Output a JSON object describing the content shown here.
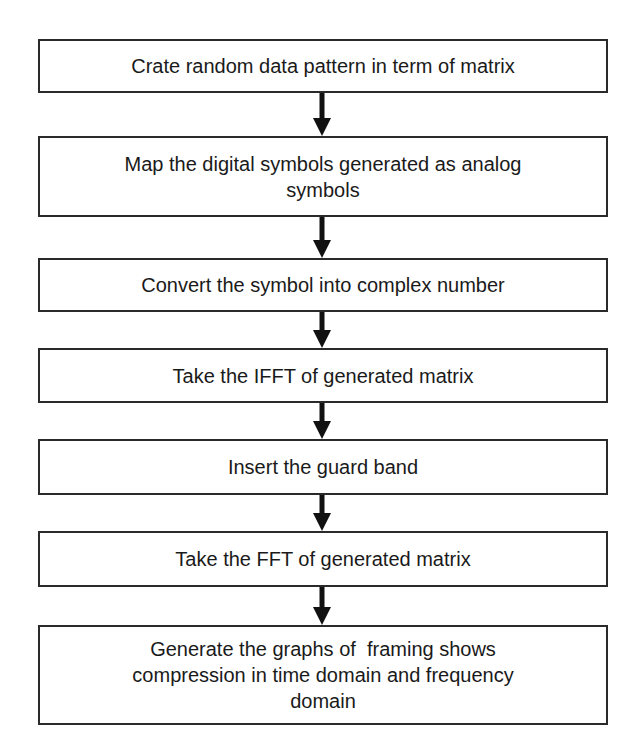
{
  "flowchart": {
    "steps": [
      {
        "label": "Crate random data pattern in term of matrix"
      },
      {
        "label": "Map the digital symbols generated as analog symbols"
      },
      {
        "label": "Convert the symbol into complex number"
      },
      {
        "label": "Take the IFFT of generated matrix"
      },
      {
        "label": "Insert the guard band"
      },
      {
        "label": "Take the FFT of generated matrix"
      },
      {
        "label": "Generate the graphs of  framing shows compression in time domain and frequency domain"
      }
    ],
    "arrow_color": "#111111",
    "border_color": "#2a2a2a"
  }
}
